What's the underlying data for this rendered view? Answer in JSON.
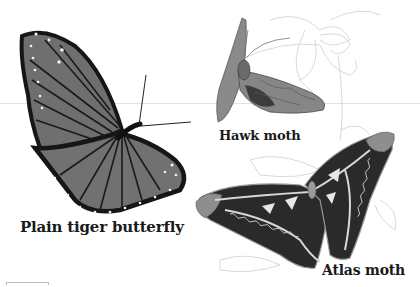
{
  "illustration": {
    "style": "grayscale scientific illustration",
    "background_color": "#ffffff",
    "specimens": [
      {
        "id": "plain-tiger",
        "label": "Plain tiger butterfly"
      },
      {
        "id": "hawk-moth",
        "label": "Hawk moth"
      },
      {
        "id": "atlas-moth",
        "label": "Atlas moth"
      }
    ],
    "colors": {
      "wing_dark": "#1c1c1c",
      "wing_mid": "#6e6e6e",
      "wing_light": "#9a9a9a",
      "flower_line": "#c8c8c8"
    }
  }
}
